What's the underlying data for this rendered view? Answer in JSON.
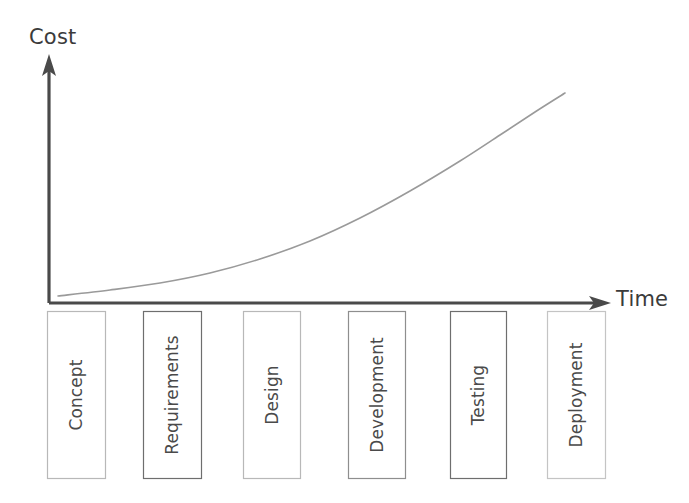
{
  "diagram": {
    "title_text_visible": false,
    "axes": {
      "y_axis": {
        "label": "Cost",
        "icon": "arrow-up-icon",
        "color": "#4a4a4a",
        "x": 49,
        "top_y": 57,
        "bottom_y": 303
      },
      "x_axis": {
        "label": "Time",
        "icon": "arrow-right-icon",
        "color": "#4a4a4a",
        "y": 303,
        "left_x": 49,
        "right_x": 608
      }
    },
    "curve": {
      "name": "cost-of-change-curve",
      "color": "#9a9a9a",
      "stroke_width": 1.6,
      "shape": "exponential-growth",
      "points": [
        [
          58,
          296
        ],
        [
          110,
          290
        ],
        [
          160,
          283
        ],
        [
          210,
          273
        ],
        [
          260,
          259
        ],
        [
          310,
          241
        ],
        [
          360,
          218
        ],
        [
          410,
          191
        ],
        [
          460,
          161
        ],
        [
          500,
          135
        ],
        [
          535,
          112
        ],
        [
          565,
          93
        ]
      ]
    },
    "phases": [
      {
        "label": "Concept",
        "x": 47,
        "width": 58,
        "border_color": "#b8b8b8"
      },
      {
        "label": "Requirements",
        "x": 143,
        "width": 58,
        "border_color": "#6e6e6e"
      },
      {
        "label": "Design",
        "x": 243,
        "width": 57,
        "border_color": "#b8b8b8"
      },
      {
        "label": "Development",
        "x": 348,
        "width": 57,
        "border_color": "#8e8e8e"
      },
      {
        "label": "Testing",
        "x": 450,
        "width": 56,
        "border_color": "#6e6e6e"
      },
      {
        "label": "Deployment",
        "x": 547,
        "width": 58,
        "border_color": "#c4c4c4"
      }
    ],
    "phase_box_geometry": {
      "top": 311,
      "bottom": 478,
      "height": 167
    }
  },
  "chart_data": {
    "type": "line",
    "title": "",
    "xlabel": "Time",
    "ylabel": "Cost",
    "grid": false,
    "legend": "none",
    "categories": [
      "Concept",
      "Requirements",
      "Design",
      "Development",
      "Testing",
      "Deployment"
    ],
    "series": [
      {
        "name": "Cost of change",
        "description": "Relative cost of making a change at each project phase (exponential growth)",
        "x": [
          0,
          1,
          2,
          3,
          4,
          5
        ],
        "values": [
          1,
          2,
          5,
          12,
          30,
          75
        ]
      }
    ],
    "xlim": [
      0,
      5
    ],
    "ylim": [
      0,
      100
    ],
    "annotations": []
  }
}
